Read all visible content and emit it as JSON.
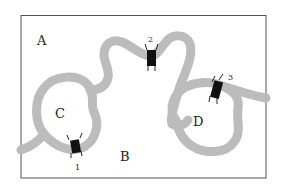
{
  "diagram": {
    "type": "hand-drawn region map with river and bridges",
    "regions": [
      {
        "id": "A",
        "label": "A"
      },
      {
        "id": "B",
        "label": "B"
      },
      {
        "id": "C",
        "label": "C"
      },
      {
        "id": "D",
        "label": "D"
      }
    ],
    "bridges": [
      {
        "id": "1",
        "label": "1"
      },
      {
        "id": "2",
        "label": "2"
      },
      {
        "id": "3",
        "label": "3"
      }
    ],
    "colors": {
      "river": "#b8b8b8",
      "bridge": "#111111",
      "frame": "#555555"
    }
  }
}
